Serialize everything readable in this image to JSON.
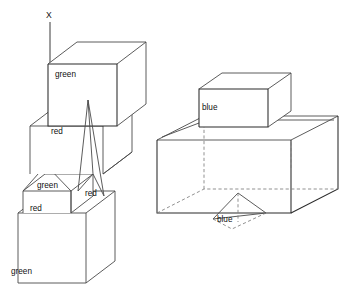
{
  "figure": {
    "background_color": "#ffffff",
    "line_color": "#4a4a4a",
    "hidden_line_color": "#7d7d7d",
    "label_color": "#111111"
  },
  "axis": {
    "label": "X",
    "label_x": 50,
    "label_y": 18,
    "line_x1": 50,
    "line_y1": 22,
    "line_x2": 50,
    "line_y2": 165
  },
  "left_scene": {
    "name": "staircase-blocks-scene",
    "labels": [
      {
        "id": "label-green-top",
        "text": "green",
        "x": 55,
        "y": 77,
        "color_name": "green"
      },
      {
        "id": "label-red-upper",
        "text": "red",
        "x": 51,
        "y": 134,
        "color_name": "red"
      },
      {
        "id": "label-green-pyramid",
        "text": "green",
        "x": 37,
        "y": 188,
        "color_name": "green"
      },
      {
        "id": "label-red-right",
        "text": "red",
        "x": 85,
        "y": 196,
        "color_name": "red"
      },
      {
        "id": "label-red-lower",
        "text": "red",
        "x": 30,
        "y": 211,
        "color_name": "red"
      },
      {
        "id": "label-green-bottom",
        "text": "green",
        "x": 11,
        "y": 274,
        "color_name": "green"
      }
    ],
    "shapes": [
      {
        "id": "top-green-box",
        "type": "box",
        "color_name": "green"
      },
      {
        "id": "upper-red-box",
        "type": "box",
        "color_name": "red"
      },
      {
        "id": "tall-red-cone",
        "type": "cone",
        "color_name": "red"
      },
      {
        "id": "green-pyramid",
        "type": "pyramid",
        "color_name": "green"
      },
      {
        "id": "lower-red-box",
        "type": "box",
        "color_name": "red"
      },
      {
        "id": "bottom-green-box",
        "type": "box",
        "color_name": "green"
      }
    ]
  },
  "right_scene": {
    "name": "open-container-scene",
    "labels": [
      {
        "id": "label-blue-cube",
        "text": "blue",
        "x": 202,
        "y": 110,
        "color_name": "blue"
      },
      {
        "id": "label-blue-cone",
        "text": "blue",
        "x": 217,
        "y": 222,
        "color_name": "blue"
      }
    ],
    "shapes": [
      {
        "id": "blue-cube",
        "type": "box",
        "color_name": "blue"
      },
      {
        "id": "open-container",
        "type": "container",
        "color_name": "none"
      },
      {
        "id": "blue-inner-cone",
        "type": "cone",
        "color_name": "blue"
      }
    ]
  },
  "color_legend": {
    "green": "#2f8f3f",
    "red": "#c23b22",
    "blue": "#2a56c6"
  }
}
